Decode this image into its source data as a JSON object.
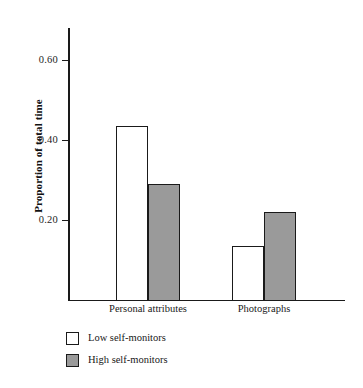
{
  "chart_data": {
    "type": "bar",
    "title": "",
    "xlabel": "",
    "ylabel": "Proportion of total time",
    "categories": [
      "Personal attributes",
      "Photographs"
    ],
    "series": [
      {
        "name": "Low self-monitors",
        "values": [
          0.435,
          0.135
        ],
        "color": "#ffffff"
      },
      {
        "name": "High self-monitors",
        "values": [
          0.29,
          0.22
        ],
        "color": "#9a9a9a"
      }
    ],
    "ylim": [
      0,
      0.68
    ],
    "yticks": [
      0.2,
      0.4,
      0.6
    ],
    "ytick_labels": [
      "0.20",
      "0.40",
      "0.60"
    ],
    "grid": false,
    "legend_position": "below-left"
  },
  "axis": {
    "y_title": "Proportion of total time",
    "y_tick_labels": [
      "0.20",
      "0.40",
      "0.60"
    ]
  },
  "categories": [
    {
      "label": "Personal attributes"
    },
    {
      "label": "Photographs"
    }
  ],
  "legend": {
    "items": [
      {
        "label": "Low self-monitors",
        "swatch": "white-square"
      },
      {
        "label": "High self-monitors",
        "swatch": "gray-square"
      }
    ]
  },
  "colors": {
    "low_fill": "#ffffff",
    "high_fill": "#9a9a9a",
    "outline": "#1a1a1a",
    "background": "#ffffff"
  }
}
